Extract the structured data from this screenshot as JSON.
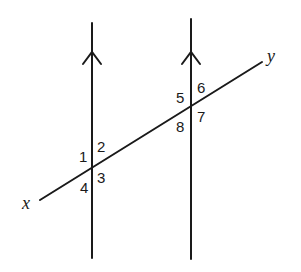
{
  "diagram": {
    "transversal": {
      "start_label": "x",
      "end_label": "y"
    },
    "parallel_lines": [
      {
        "name": "left-line",
        "marker": "arrow-up"
      },
      {
        "name": "right-line",
        "marker": "arrow-up"
      }
    ],
    "angles": {
      "a1": "1",
      "a2": "2",
      "a3": "3",
      "a4": "4",
      "a5": "5",
      "a6": "6",
      "a7": "7",
      "a8": "8"
    },
    "colors": {
      "stroke": "#1a1a1a",
      "background": "#ffffff"
    }
  }
}
